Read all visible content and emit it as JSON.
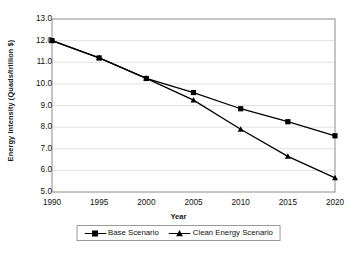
{
  "chart_data": {
    "type": "line",
    "title": "",
    "xlabel": "Year",
    "ylabel": "Energy Intensity (Quads/trillion $)",
    "x": [
      1990,
      1995,
      2000,
      2005,
      2010,
      2015,
      2020
    ],
    "categories": [
      "1990",
      "1995",
      "2000",
      "2005",
      "2010",
      "2015",
      "2020"
    ],
    "xlim": [
      1990,
      2020
    ],
    "ylim": [
      5.0,
      13.0
    ],
    "yticks": [
      "13.0",
      "12.0",
      "11.0",
      "10.0",
      "9.0",
      "8.0",
      "7.0",
      "6.0",
      "5.0"
    ],
    "ytick_values": [
      13.0,
      12.0,
      11.0,
      10.0,
      9.0,
      8.0,
      7.0,
      6.0,
      5.0
    ],
    "grid": "horizontal",
    "legend_position": "bottom",
    "series": [
      {
        "name": "Base Scenario",
        "marker": "square",
        "color": "#000000",
        "values": [
          12.0,
          11.2,
          10.25,
          9.6,
          8.85,
          8.25,
          7.6
        ]
      },
      {
        "name": "Clean Energy Scenario",
        "marker": "triangle",
        "color": "#000000",
        "values": [
          12.0,
          11.2,
          10.25,
          9.25,
          7.9,
          6.65,
          5.65
        ]
      }
    ]
  },
  "legend": {
    "entries": [
      {
        "label": "Base Scenario",
        "marker": "square-marker-icon"
      },
      {
        "label": "Clean Energy Scenario",
        "marker": "triangle-marker-icon"
      }
    ]
  },
  "axes": {
    "x_title": "Year",
    "y_title": "Energy Intensity (Quads/trillion $)"
  },
  "colors": {
    "series": "#000000",
    "grid": "#d8d8d8",
    "frame": "#8c8c8c",
    "background": "#ffffff"
  }
}
